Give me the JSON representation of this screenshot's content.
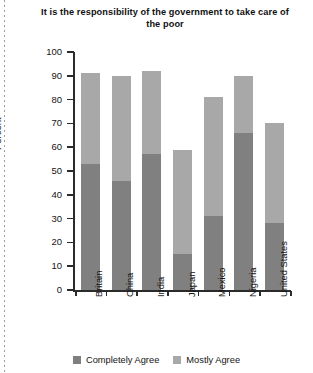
{
  "chart_data": {
    "type": "bar",
    "subtype": "stacked-bar",
    "title": "It is the responsibility of the government to take care of the poor",
    "xlabel": "",
    "ylabel": "Percent",
    "ylim": [
      0,
      100
    ],
    "ytick_step": 10,
    "yticks": [
      0,
      10,
      20,
      30,
      40,
      50,
      60,
      70,
      80,
      90,
      100
    ],
    "grid": false,
    "legend_position": "bottom",
    "categories": [
      "Britain",
      "China",
      "India",
      "Japan",
      "Mexico",
      "Nigeria",
      "United States"
    ],
    "series": [
      {
        "name": "Completely Agree",
        "color": "#808080",
        "values": [
          53,
          46,
          57,
          15,
          31,
          66,
          28
        ]
      },
      {
        "name": "Mostly Agree",
        "color": "#a8a8a8",
        "values": [
          38,
          44,
          35,
          44,
          50,
          24,
          42
        ]
      }
    ],
    "totals": [
      91,
      90,
      92,
      59,
      81,
      90,
      70
    ]
  },
  "legend": {
    "items": [
      {
        "label": "Completely Agree",
        "color": "#808080"
      },
      {
        "label": "Mostly Agree",
        "color": "#a8a8a8"
      }
    ]
  }
}
